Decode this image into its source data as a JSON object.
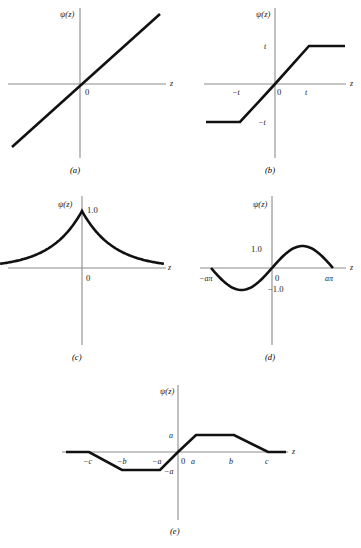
{
  "figure": {
    "title": "",
    "background_color": "#ffffff",
    "curve_color": "#111111",
    "axis_color": "#8c8c8c",
    "axis_label_y": "ψ(z)",
    "axis_label_x": "z",
    "origin_label": "0"
  },
  "chart_data": [
    {
      "id": "panel-a",
      "type": "line",
      "caption": "(a)",
      "title": "",
      "xlabel": "z",
      "ylabel": "ψ(z)",
      "description": "Identity / least-squares influence function psi(z) = z",
      "x_ticks": [
        "0"
      ],
      "y_ticks": [],
      "grid": false,
      "legend": "none",
      "xlim": [
        -1.15,
        1.15
      ],
      "ylim": [
        -1.1,
        1.1
      ],
      "x": [
        -1.0,
        1.0
      ],
      "values": [
        -1.0,
        1.0
      ]
    },
    {
      "id": "panel-b",
      "type": "line",
      "caption": "(b)",
      "title": "",
      "xlabel": "z",
      "ylabel": "ψ(z)",
      "description": "Huber clipped-linear influence function, saturating at +/- t",
      "x_ticks": [
        "−t",
        "0",
        "t"
      ],
      "y_ticks": [
        "t",
        "−t"
      ],
      "grid": false,
      "legend": "none",
      "xlim": [
        -2.2,
        2.2
      ],
      "ylim": [
        -1.55,
        1.55
      ],
      "x": [
        -2.1,
        -1.0,
        0.0,
        1.0,
        2.1
      ],
      "values": [
        -1.0,
        -1.0,
        0.0,
        1.0,
        1.0
      ]
    },
    {
      "id": "panel-c",
      "type": "line",
      "caption": "(c)",
      "title": "",
      "xlabel": "z",
      "ylabel": "ψ(z)",
      "description": "Two-sided exponential (Laplace) weight function peaking at 1.0 with a cusp at z = 0",
      "x_ticks": [
        "0"
      ],
      "y_ticks": [
        "1.0"
      ],
      "grid": false,
      "legend": "none",
      "xlim": [
        -2.6,
        2.6
      ],
      "ylim": [
        0.0,
        1.1
      ],
      "x": [
        -2.6,
        -2.0,
        -1.5,
        -1.0,
        -0.6,
        -0.3,
        0.0,
        0.3,
        0.6,
        1.0,
        1.5,
        2.0,
        2.6
      ],
      "values": [
        0.07,
        0.13,
        0.22,
        0.37,
        0.55,
        0.74,
        1.0,
        0.74,
        0.55,
        0.37,
        0.22,
        0.13,
        0.07
      ]
    },
    {
      "id": "panel-d",
      "type": "line",
      "caption": "(d)",
      "title": "",
      "xlabel": "z",
      "ylabel": "ψ(z)",
      "description": "Andrews sine wave influence function, one full period between -aπ and aπ",
      "x_ticks": [
        "−aπ",
        "0",
        "aπ"
      ],
      "y_ticks": [
        "1.0",
        "−1.0"
      ],
      "grid": false,
      "legend": "none",
      "xlim": [
        -1.25,
        1.25
      ],
      "ylim": [
        -1.25,
        1.25
      ],
      "x": [
        -1.0,
        -0.75,
        -0.5,
        -0.25,
        0.0,
        0.25,
        0.5,
        0.75,
        1.0
      ],
      "values": [
        0.0,
        -0.707,
        -1.0,
        -0.707,
        0.0,
        0.707,
        1.0,
        0.707,
        0.0
      ]
    },
    {
      "id": "panel-e",
      "type": "line",
      "caption": "(e)",
      "title": "",
      "xlabel": "z",
      "ylabel": "ψ(z)",
      "description": "Hampel three-part redescending influence function with breakpoints a, b, c",
      "x_ticks": [
        "−c",
        "−b",
        "−a",
        "0",
        "a",
        "b",
        "c"
      ],
      "y_ticks": [
        "a",
        "−a"
      ],
      "grid": false,
      "legend": "none",
      "xlim": [
        -3.6,
        3.6
      ],
      "ylim": [
        -1.45,
        1.45
      ],
      "x": [
        -3.4,
        -3.0,
        -2.0,
        -1.0,
        0.0,
        1.0,
        2.0,
        3.0,
        3.4
      ],
      "values": [
        0.0,
        0.0,
        -1.0,
        -1.0,
        0.0,
        1.0,
        1.0,
        0.0,
        0.0
      ]
    }
  ],
  "panels": {
    "a": {
      "caption": "(a)",
      "y_axis_label": "ψ(z)",
      "x_axis_label": "z",
      "origin": "0"
    },
    "b": {
      "caption": "(b)",
      "y_axis_label": "ψ(z)",
      "x_axis_label": "z",
      "origin": "0",
      "tick_neg_t": "−t",
      "tick_pos_t": "t",
      "y_pos_t": "t",
      "y_neg_t": "−t"
    },
    "c": {
      "caption": "(c)",
      "y_axis_label": "ψ(z)",
      "x_axis_label": "z",
      "origin": "0",
      "peak": "1.0"
    },
    "d": {
      "caption": "(d)",
      "y_axis_label": "ψ(z)",
      "x_axis_label": "z",
      "origin": "0",
      "tick_neg": "−aπ",
      "tick_pos": "aπ",
      "y_pos": "1.0",
      "y_neg": "−1.0"
    },
    "e": {
      "caption": "(e)",
      "y_axis_label": "ψ(z)",
      "x_axis_label": "z",
      "origin": "0",
      "tick_neg_c": "−c",
      "tick_neg_b": "−b",
      "tick_neg_a": "−a",
      "tick_pos_a": "a",
      "tick_pos_b": "b",
      "tick_pos_c": "c",
      "y_pos_a": "a",
      "y_neg_a": "−a"
    }
  }
}
